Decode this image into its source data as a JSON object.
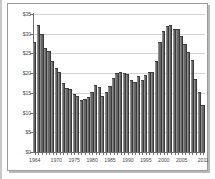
{
  "chart_data": {
    "type": "bar",
    "title": "",
    "subtitle": "",
    "xlabel": "",
    "ylabel": "",
    "ylim": [
      0,
      35
    ],
    "grid": true,
    "legend": "none",
    "y_tick_labels": [
      "$35",
      "$30",
      "$25",
      "$20",
      "$15",
      "$10",
      "$5",
      "$0"
    ],
    "y_tick_values": [
      35,
      30,
      25,
      20,
      15,
      10,
      5,
      0
    ],
    "x_tick_labels": [
      "1964",
      "1970",
      "1975",
      "1980",
      "1985",
      "1990",
      "1995",
      "2000",
      "2005",
      "2011"
    ],
    "x_tick_years": [
      1964,
      1970,
      1975,
      1980,
      1985,
      1990,
      1995,
      2000,
      2005,
      2011
    ],
    "categories": [
      "1964",
      "1965",
      "1966",
      "1967",
      "1968",
      "1969",
      "1970",
      "1971",
      "1972",
      "1973",
      "1974",
      "1975",
      "1976",
      "1977",
      "1978",
      "1979",
      "1980",
      "1981",
      "1982",
      "1983",
      "1984",
      "1985",
      "1986",
      "1987",
      "1988",
      "1989",
      "1990",
      "1991",
      "1992",
      "1993",
      "1994",
      "1995",
      "1996",
      "1997",
      "1998",
      "1999",
      "2000",
      "2001",
      "2002",
      "2003",
      "2004",
      "2005",
      "2006",
      "2007",
      "2008",
      "2009",
      "2010",
      "2011"
    ],
    "values": [
      27.8,
      32.3,
      30.0,
      26.5,
      25.7,
      23.0,
      21.3,
      20.3,
      17.5,
      16.3,
      16.0,
      14.7,
      14.2,
      13.2,
      13.5,
      14.0,
      15.3,
      17.0,
      16.5,
      14.3,
      15.3,
      16.7,
      18.8,
      20.0,
      20.2,
      20.0,
      19.7,
      18.2,
      17.8,
      19.4,
      18.3,
      19.5,
      20.2,
      20.3,
      23.2,
      28.0,
      30.7,
      32.0,
      32.2,
      31.3,
      31.2,
      29.5,
      27.3,
      25.3,
      23.3,
      18.6,
      15.3,
      11.8
    ],
    "colors": {
      "bar_fill": "#7d7d7d",
      "bar_edge": "#3f3f3f",
      "grid": "#d2d2d2",
      "axis": "#6e6e6e",
      "text": "#4a4a4a",
      "background": "#ffffff",
      "frame": "#9b9b9b"
    }
  }
}
